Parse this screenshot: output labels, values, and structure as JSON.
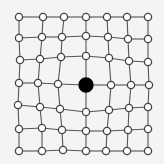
{
  "diagram": {
    "background": "#f4f4f4",
    "line_color": "#555555",
    "node_fill": "#ffffff",
    "node_stroke": "#444444",
    "center_fill": "#000000",
    "rows": 7,
    "cols": 7,
    "node_radius": 3.6,
    "center_radius": 7,
    "center_index": [
      3,
      3
    ],
    "nodes": [
      [
        [
          19,
          17
        ],
        [
          43,
          17
        ],
        [
          64,
          17
        ],
        [
          86,
          17
        ],
        [
          107,
          17
        ],
        [
          127,
          17
        ],
        [
          148,
          17
        ]
      ],
      [
        [
          19,
          38
        ],
        [
          42,
          37
        ],
        [
          62,
          37
        ],
        [
          86,
          36
        ],
        [
          108,
          37
        ],
        [
          128,
          39
        ],
        [
          148,
          39
        ]
      ],
      [
        [
          20,
          60
        ],
        [
          40,
          59
        ],
        [
          61,
          57
        ],
        [
          86,
          56
        ],
        [
          109,
          58
        ],
        [
          129,
          61
        ],
        [
          148,
          62
        ]
      ],
      [
        [
          19,
          83
        ],
        [
          38,
          83
        ],
        [
          58,
          84
        ],
        [
          86,
          85
        ],
        [
          111,
          85
        ],
        [
          131,
          85
        ],
        [
          149,
          85
        ]
      ],
      [
        [
          18,
          105
        ],
        [
          40,
          107
        ],
        [
          60,
          109
        ],
        [
          86,
          112
        ],
        [
          109,
          110
        ],
        [
          129,
          108
        ],
        [
          148,
          107
        ]
      ],
      [
        [
          19,
          129
        ],
        [
          42,
          128
        ],
        [
          62,
          130
        ],
        [
          86,
          131
        ],
        [
          107,
          131
        ],
        [
          128,
          130
        ],
        [
          148,
          129
        ]
      ],
      [
        [
          19,
          151
        ],
        [
          42,
          151
        ],
        [
          63,
          150
        ],
        [
          86,
          151
        ],
        [
          106,
          151
        ],
        [
          127,
          151
        ],
        [
          148,
          151
        ]
      ]
    ]
  }
}
